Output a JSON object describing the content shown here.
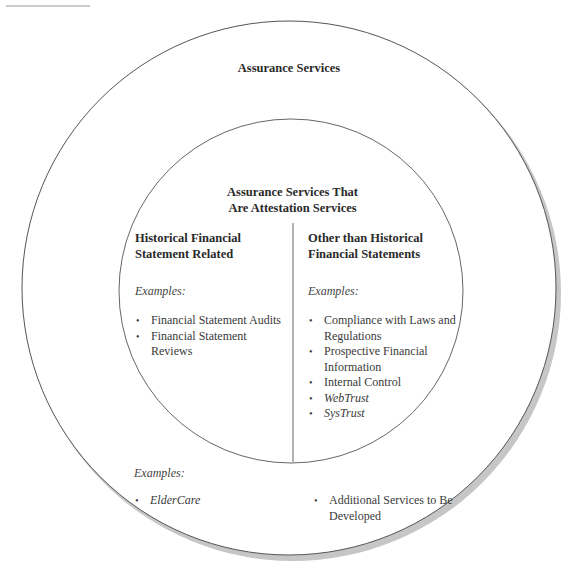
{
  "diagram": {
    "outer_circle": {
      "title": "Assurance Services",
      "examples_label": "Examples:",
      "left_examples": [
        {
          "text": "ElderCare",
          "italic": true
        }
      ],
      "right_examples": [
        {
          "text": "Additional Services to Be Developed",
          "italic": false
        }
      ]
    },
    "inner_circle": {
      "title_line1": "Assurance Services That",
      "title_line2": "Are Attestation Services",
      "left": {
        "heading_line1": "Historical Financial",
        "heading_line2": "Statement Related",
        "examples_label": "Examples:",
        "items": [
          {
            "text": "Financial Statement Audits",
            "italic": false
          },
          {
            "text": "Financial Statement Reviews",
            "italic": false
          }
        ]
      },
      "right": {
        "heading_line1": "Other than Historical",
        "heading_line2": "Financial Statements",
        "examples_label": "Examples:",
        "items": [
          {
            "text": "Compliance with Laws and Regulations",
            "italic": false
          },
          {
            "text": "Prospective Financial Information",
            "italic": false
          },
          {
            "text": "Internal Control",
            "italic": false
          },
          {
            "text": "WebTrust",
            "italic": true
          },
          {
            "text": "SysTrust",
            "italic": true
          }
        ]
      }
    },
    "colors": {
      "stroke": "#555555",
      "shadow": "#c4c4c4",
      "text": "#333333"
    }
  }
}
